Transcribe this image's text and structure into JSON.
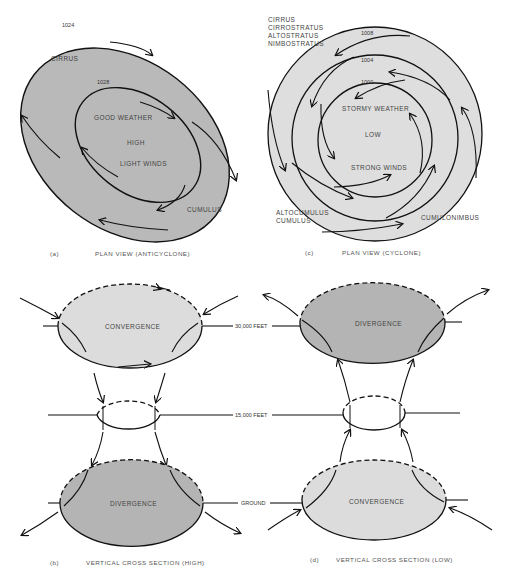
{
  "figure": {
    "colors": {
      "anticyclone_fill": "#b9b9b9",
      "cyclone_fill": "#dedede",
      "convergence_fill": "#dcdcdc",
      "divergence_fill": "#b4b4b4",
      "line": "#111111"
    },
    "panel_a": {
      "letter": "(a)",
      "caption": "PLAN VIEW (ANTICYCLONE)",
      "isobars": [
        "1024",
        "1028"
      ],
      "labels": {
        "cloud_outer": "CIRRUS",
        "good_weather": "GOOD WEATHER",
        "center": "HIGH",
        "winds": "LIGHT WINDS",
        "cloud_lower": "CUMULUS"
      }
    },
    "panel_c": {
      "letter": "(c)",
      "caption": "PLAN VIEW (CYCLONE)",
      "isobars": [
        "1008",
        "1004",
        "1000"
      ],
      "cloud_upper": [
        "CIRRUS",
        "CIRROSTRATUS",
        "ALTOSTRATUS",
        "NIMBOSTRATUS"
      ],
      "cloud_lower_left": [
        "ALTOCUMULUS",
        "CUMULUS"
      ],
      "cloud_lower_right": "CUMULONIMBUS",
      "labels": {
        "weather": "STORMY WEATHER",
        "center": "LOW",
        "winds": "STRONG WINDS"
      }
    },
    "panel_b": {
      "letter": "(b)",
      "caption": "VERTICAL CROSS SECTION (HIGH)",
      "top_label": "CONVERGENCE",
      "bottom_label": "DIVERGENCE"
    },
    "panel_d": {
      "letter": "(d)",
      "caption": "VERTICAL CROSS SECTION (LOW)",
      "top_label": "DIVERGENCE",
      "bottom_label": "CONVERGENCE"
    },
    "levels": {
      "upper": "30,000 FEET",
      "middle": "15,000 FEET",
      "ground": "GROUND"
    }
  }
}
